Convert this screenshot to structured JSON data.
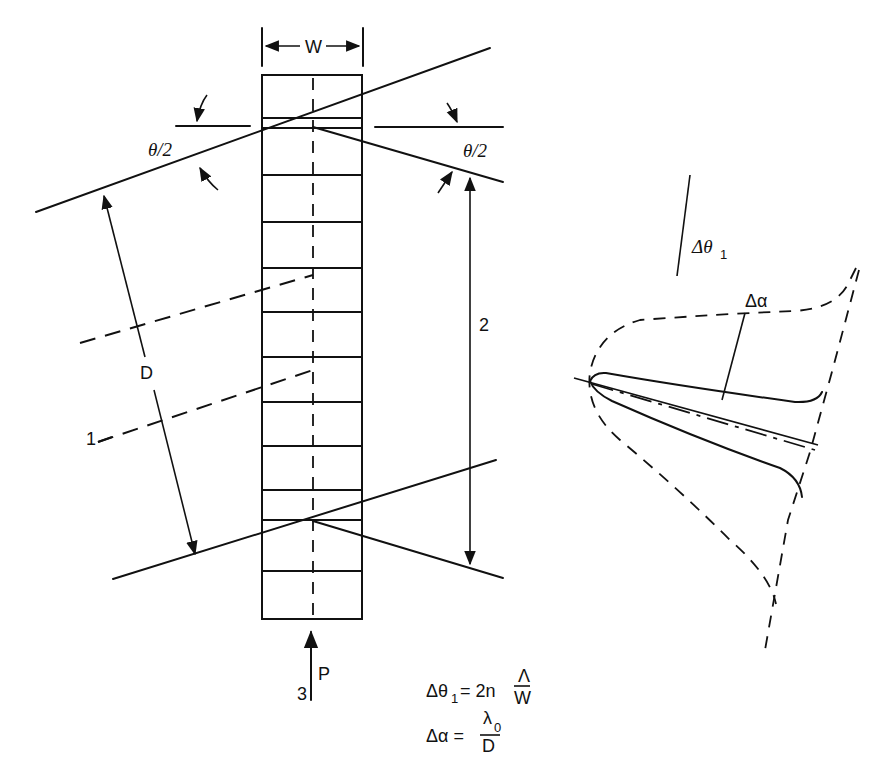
{
  "figure": {
    "width_label": "W",
    "angle_label_left": "θ/2",
    "angle_label_right": "θ/2",
    "spacing_label": "D",
    "callout_1": "1",
    "callout_2": "2",
    "callout_3": "3",
    "beam_label": "P",
    "stack": {
      "cells": 12
    }
  },
  "curve_plot": {
    "label_delta_theta": "Δθ",
    "label_delta_theta_sub": "1",
    "label_delta_alpha": "Δα"
  },
  "equations": {
    "eq1_lhs": "Δθ",
    "eq1_lhs_sub": "1",
    "eq1_mid": " = 2n",
    "eq1_num": "Λ",
    "eq1_den": "W",
    "eq2_lhs": "Δα =",
    "eq2_num": "λ",
    "eq2_num_sub": "0",
    "eq2_den": "D"
  }
}
